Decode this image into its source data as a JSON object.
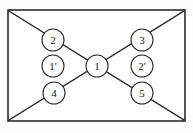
{
  "figure": {
    "background_color": "#fefefe",
    "stroke_color": "#2b2b2b",
    "node_fill_color": "#ffffff",
    "label_color": "#1a1a1a"
  },
  "frame": {
    "name": "outer-rectangle",
    "x": 8,
    "y": 10,
    "width": 177,
    "height": 111
  },
  "diagonals": [
    {
      "name": "diagonal-top-left-to-bottom-right",
      "x1": 9,
      "y1": 11,
      "x2": 184,
      "y2": 120
    },
    {
      "name": "diagonal-bottom-left-to-top-right",
      "x1": 9,
      "y1": 120,
      "x2": 184,
      "y2": 11
    }
  ],
  "nodes": [
    {
      "id": "node-2",
      "label": "2",
      "cx": 53,
      "cy": 40,
      "r": 11,
      "on_diagonal": true
    },
    {
      "id": "node-3",
      "label": "3",
      "cx": 142,
      "cy": 40,
      "r": 11,
      "on_diagonal": true
    },
    {
      "id": "node-1p",
      "label": "1'",
      "cx": 53,
      "cy": 66,
      "r": 11,
      "on_diagonal": false
    },
    {
      "id": "node-1",
      "label": "1",
      "cx": 97,
      "cy": 66,
      "r": 11,
      "on_diagonal": true
    },
    {
      "id": "node-2p",
      "label": "2'",
      "cx": 142,
      "cy": 66,
      "r": 11,
      "on_diagonal": false
    },
    {
      "id": "node-4",
      "label": "4",
      "cx": 54,
      "cy": 93,
      "r": 11,
      "on_diagonal": true
    },
    {
      "id": "node-5",
      "label": "5",
      "cx": 142,
      "cy": 93,
      "r": 11,
      "on_diagonal": true
    }
  ]
}
